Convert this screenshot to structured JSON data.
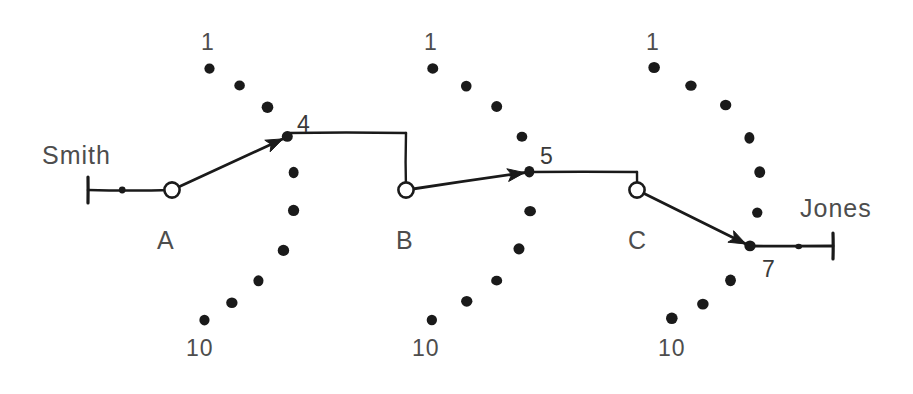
{
  "diagram": {
    "ink_color": "#1a1a1a",
    "label_color": "#4d4d4d",
    "background": "#ffffff",
    "width": 913,
    "height": 394
  },
  "endpoints": {
    "source_label": "Smith",
    "source_x": 42,
    "source_y": 155,
    "destination_label": "Jones",
    "destination_x": 800,
    "destination_y": 212
  },
  "switches": [
    {
      "id": "A",
      "label": "A",
      "label_x": 157,
      "label_y": 228,
      "pivot_x": 172,
      "pivot_y": 190,
      "first_label": "1",
      "first_label_x": 201,
      "first_label_y": 31,
      "last_label": "10",
      "last_label_x": 186,
      "last_label_y": 337,
      "selected_position": "4",
      "selected_label_x": 297,
      "selected_label_y": 113,
      "wiper_tip_x": 287,
      "wiper_tip_y": 137,
      "contacts": [
        {
          "n": 1,
          "x": 210,
          "y": 68
        },
        {
          "n": 2,
          "x": 239,
          "y": 86
        },
        {
          "n": 3,
          "x": 268,
          "y": 107
        },
        {
          "n": 4,
          "x": 287,
          "y": 137
        },
        {
          "n": 5,
          "x": 294,
          "y": 172
        },
        {
          "n": 6,
          "x": 294,
          "y": 211
        },
        {
          "n": 7,
          "x": 283,
          "y": 250
        },
        {
          "n": 8,
          "x": 259,
          "y": 281
        },
        {
          "n": 9,
          "x": 232,
          "y": 303
        },
        {
          "n": 10,
          "x": 204,
          "y": 320
        }
      ]
    },
    {
      "id": "B",
      "label": "B",
      "label_x": 396,
      "label_y": 228,
      "pivot_x": 406,
      "pivot_y": 190,
      "first_label": "1",
      "first_label_x": 424,
      "first_label_y": 31,
      "last_label": "10",
      "last_label_x": 412,
      "last_label_y": 337,
      "selected_position": "5",
      "selected_label_x": 540,
      "selected_label_y": 145,
      "wiper_tip_x": 529,
      "wiper_tip_y": 172,
      "contacts": [
        {
          "n": 1,
          "x": 433,
          "y": 68
        },
        {
          "n": 2,
          "x": 466,
          "y": 86
        },
        {
          "n": 3,
          "x": 497,
          "y": 107
        },
        {
          "n": 4,
          "x": 522,
          "y": 137
        },
        {
          "n": 5,
          "x": 529,
          "y": 172
        },
        {
          "n": 6,
          "x": 530,
          "y": 211
        },
        {
          "n": 7,
          "x": 519,
          "y": 249
        },
        {
          "n": 8,
          "x": 497,
          "y": 281
        },
        {
          "n": 9,
          "x": 467,
          "y": 301
        },
        {
          "n": 10,
          "x": 432,
          "y": 320
        }
      ]
    },
    {
      "id": "C",
      "label": "C",
      "label_x": 628,
      "label_y": 228,
      "pivot_x": 637,
      "pivot_y": 190,
      "first_label": "1",
      "first_label_x": 646,
      "first_label_y": 31,
      "last_label": "10",
      "last_label_x": 658,
      "last_label_y": 337,
      "selected_position": "7",
      "selected_label_x": 762,
      "selected_label_y": 258,
      "wiper_tip_x": 750,
      "wiper_tip_y": 246,
      "contacts": [
        {
          "n": 1,
          "x": 654,
          "y": 68
        },
        {
          "n": 2,
          "x": 691,
          "y": 86
        },
        {
          "n": 3,
          "x": 726,
          "y": 105
        },
        {
          "n": 4,
          "x": 750,
          "y": 138
        },
        {
          "n": 5,
          "x": 760,
          "y": 172
        },
        {
          "n": 6,
          "x": 757,
          "y": 212
        },
        {
          "n": 7,
          "x": 750,
          "y": 246
        },
        {
          "n": 8,
          "x": 730,
          "y": 280
        },
        {
          "n": 9,
          "x": 703,
          "y": 304
        },
        {
          "n": 10,
          "x": 672,
          "y": 318
        }
      ]
    }
  ],
  "links": {
    "smith_terminal_x": 88,
    "smith_terminal_y": 190,
    "jones_terminal_x": 833,
    "jones_terminal_y": 246,
    "bus_a_to_b_y": 133,
    "bus_b_to_c_y": 172
  }
}
